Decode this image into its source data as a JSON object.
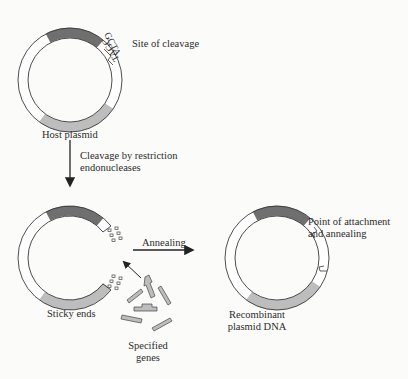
{
  "labels": {
    "site_of_cleavage": "Site of cleavage",
    "host_plasmid": "Host plasmid",
    "cleavage_line1": "Cleavage by restriction",
    "cleavage_line2": "endonucleases",
    "annealing": "Annealing",
    "sticky_ends": "Sticky ends",
    "specified_line1": "Specified",
    "specified_line2": "genes",
    "recombinant_line1": "Recombinant",
    "recombinant_line2": "plasmid DNA",
    "attachment_line1": "Point of attachment",
    "attachment_line2": "and annealing",
    "seq_outer": "GCTA",
    "seq_inner": "TAGC"
  },
  "colors": {
    "dark_segment": "#6f6f6f",
    "light_segment": "#bdbdbd",
    "outline": "#3a3a3a",
    "background": "#fbfbfa"
  }
}
